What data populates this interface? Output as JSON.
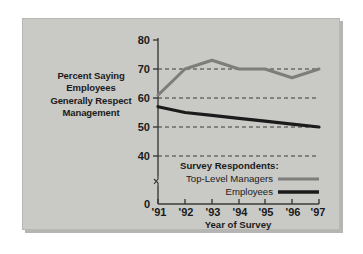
{
  "figure": {
    "background_color": "#c9c9c6",
    "page_color": "#ffffff"
  },
  "chart_data": {
    "type": "line",
    "title": "",
    "ylabel_lines": [
      "Percent Saying",
      "Employees",
      "Generally Respect",
      "Management"
    ],
    "xlabel": "Year of Survey",
    "categories": [
      "'91",
      "'92",
      "'93",
      "'94",
      "'95",
      "'96",
      "'97"
    ],
    "x": [
      1991,
      1992,
      1993,
      1994,
      1995,
      1996,
      1997
    ],
    "series": [
      {
        "name": "Top-Level Managers",
        "color": "#7d7d7a",
        "values": [
          61,
          70,
          73,
          70,
          70,
          67,
          70
        ]
      },
      {
        "name": "Employees",
        "color": "#1b1b1b",
        "values": [
          57,
          55,
          54,
          53,
          52,
          51,
          50
        ]
      }
    ],
    "yticks": [
      0,
      40,
      50,
      60,
      70,
      80
    ],
    "ytick_labels": [
      "0",
      "40",
      "50",
      "60",
      "70",
      "80"
    ],
    "ylim": [
      0,
      80
    ],
    "axis_break": true,
    "axis_break_note": "y-axis broken between 0 and 40",
    "gridlines_at": [
      40,
      50,
      60,
      70
    ],
    "grid": true,
    "grid_style": "dashed",
    "legend_position": "inside-lower-right",
    "legend_title": "Survey Respondents:"
  },
  "legend": {
    "heading": "Survey Respondents:",
    "entries": [
      {
        "label": "Top-Level Managers",
        "color": "#7d7d7a"
      },
      {
        "label": "Employees",
        "color": "#1b1b1b"
      }
    ]
  },
  "axes": {
    "y_tick_labels": [
      "80",
      "70",
      "60",
      "50",
      "40",
      "0"
    ],
    "x_tick_labels": [
      "'91",
      "'92",
      "'93",
      "'94",
      "'95",
      "'96",
      "'97"
    ],
    "x_title": "Year of Survey"
  }
}
